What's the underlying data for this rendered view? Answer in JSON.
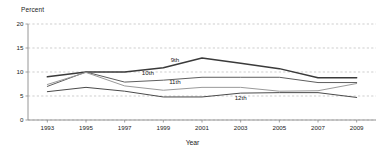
{
  "chart_data": {
    "type": "line",
    "title": "",
    "xlabel": "Year",
    "ylabel": "Percent",
    "x": [
      1993,
      1995,
      1997,
      1999,
      2001,
      2003,
      2005,
      2007,
      2009
    ],
    "xlim": [
      1992,
      2010
    ],
    "ylim": [
      0,
      20
    ],
    "ytick_labels": [
      "0",
      "5",
      "10",
      "15",
      "20"
    ],
    "ytick_values": [
      0,
      5,
      10,
      15,
      20
    ],
    "xtick_labels": [
      "1993",
      "1995",
      "1997",
      "1999",
      "2001",
      "2003",
      "2005",
      "2007",
      "2009"
    ],
    "grid": "horizontal-dashed",
    "legend": "inline-series-labels",
    "series": [
      {
        "name": "9th",
        "label": "9th",
        "color": "#3a3a3a",
        "width": 1.5,
        "values": [
          9.0,
          10.0,
          10.0,
          10.9,
          12.9,
          11.8,
          10.7,
          8.8,
          8.8
        ]
      },
      {
        "name": "10th",
        "label": "10th",
        "color": "#5e5e5e",
        "width": 1.0,
        "values": [
          7.0,
          10.0,
          7.9,
          8.3,
          8.9,
          8.9,
          8.9,
          7.8,
          7.8
        ]
      },
      {
        "name": "11th",
        "label": "11th",
        "color": "#9a9a9a",
        "width": 1.0,
        "values": [
          7.4,
          9.9,
          7.1,
          6.2,
          6.8,
          6.8,
          6.0,
          6.1,
          7.6
        ]
      },
      {
        "name": "12th",
        "label": "12th",
        "color": "#4a4a4a",
        "width": 1.0,
        "values": [
          5.9,
          6.8,
          6.0,
          4.8,
          4.8,
          5.6,
          5.7,
          5.7,
          4.7
        ]
      }
    ],
    "series_label_positions": [
      {
        "name": "9th",
        "x": 1999.6,
        "y": 12.1
      },
      {
        "name": "10th",
        "x": 1998.2,
        "y": 9.3
      },
      {
        "name": "11th",
        "x": 1999.6,
        "y": 7.5
      },
      {
        "name": "12th",
        "x": 2003.0,
        "y": 4.1
      }
    ]
  }
}
